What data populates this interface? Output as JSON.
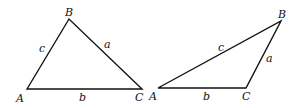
{
  "figure": {
    "triangles": [
      {
        "name": "acute-triangle",
        "vertices": {
          "A": [
            27,
            89
          ],
          "B": [
            69,
            19
          ],
          "C": [
            142,
            89
          ]
        },
        "vertex_labels": {
          "A": "A",
          "B": "B",
          "C": "C"
        },
        "side_labels": {
          "a": "a",
          "b": "b",
          "c": "c"
        }
      },
      {
        "name": "obtuse-triangle",
        "vertices": {
          "A": [
            158,
            88
          ],
          "B": [
            281,
            21
          ],
          "C": [
            246,
            88
          ]
        },
        "vertex_labels": {
          "A": "A",
          "B": "B",
          "C": "C"
        },
        "side_labels": {
          "a": "a",
          "b": "b",
          "c": "c"
        }
      }
    ],
    "colors": {
      "stroke": "#111111",
      "background": "#ffffff"
    }
  }
}
